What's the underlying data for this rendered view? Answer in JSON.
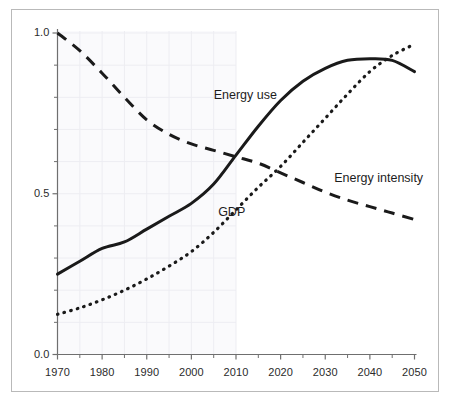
{
  "chart_data": {
    "type": "line",
    "title": "",
    "subtitle": "",
    "xlabel": "",
    "ylabel": "",
    "xlim": [
      1970,
      2050
    ],
    "ylim": [
      0.0,
      1.0
    ],
    "grid": "faint grid visible on left portion of plot only (1970-2010)",
    "legend_position": "inline annotations next to curves",
    "x_tick_labels": [
      "1970",
      "1980",
      "1990",
      "2000",
      "2010",
      "2020",
      "2030",
      "2040",
      "2050"
    ],
    "x_tick_values": [
      1970,
      1980,
      1990,
      2000,
      2010,
      2020,
      2030,
      2040,
      2050
    ],
    "x_minor_tick_values": [
      1975,
      1985,
      1995,
      2005,
      2015,
      2025,
      2035,
      2045
    ],
    "y_tick_labels": [
      "0.0",
      "0.5",
      "1.0"
    ],
    "y_tick_values": [
      0.0,
      0.5,
      1.0
    ],
    "y_minor_tick_values": [
      0.1,
      0.2,
      0.3,
      0.4,
      0.6,
      0.7,
      0.8,
      0.9
    ],
    "x": [
      1970,
      1975,
      1980,
      1985,
      1990,
      1995,
      2000,
      2005,
      2010,
      2015,
      2020,
      2025,
      2030,
      2035,
      2040,
      2045,
      2050
    ],
    "series": [
      {
        "name": "Energy use",
        "style": "solid",
        "color": "#1a1a1a",
        "label_text": "Energy use",
        "values": [
          0.25,
          0.29,
          0.33,
          0.35,
          0.39,
          0.43,
          0.47,
          0.53,
          0.62,
          0.71,
          0.79,
          0.85,
          0.89,
          0.915,
          0.92,
          0.915,
          0.88
        ]
      },
      {
        "name": "GDP",
        "style": "dotted",
        "color": "#1a1a1a",
        "label_text": "GDP",
        "values": [
          0.125,
          0.145,
          0.17,
          0.2,
          0.235,
          0.275,
          0.32,
          0.38,
          0.45,
          0.52,
          0.585,
          0.66,
          0.735,
          0.81,
          0.88,
          0.93,
          0.965
        ]
      },
      {
        "name": "Energy intensity",
        "style": "dashed",
        "color": "#1a1a1a",
        "label_text": "Energy intensity",
        "values": [
          1.0,
          0.945,
          0.875,
          0.8,
          0.73,
          0.685,
          0.655,
          0.635,
          0.615,
          0.595,
          0.565,
          0.535,
          0.505,
          0.48,
          0.46,
          0.44,
          0.42
        ]
      }
    ],
    "annotations": [
      {
        "text": "Energy use",
        "x": 2005,
        "y": 0.805
      },
      {
        "text": "Energy intensity",
        "x": 2032,
        "y": 0.545
      },
      {
        "text": "GDP",
        "x": 2006,
        "y": 0.44
      }
    ]
  },
  "axis": {
    "y_labels": [
      {
        "text": "1.0",
        "value": 1.0
      },
      {
        "text": "0.5",
        "value": 0.5
      },
      {
        "text": "0.0",
        "value": 0.0
      }
    ],
    "x_labels": [
      {
        "text": "1970",
        "value": 1970
      },
      {
        "text": "1980",
        "value": 1980
      },
      {
        "text": "1990",
        "value": 1990
      },
      {
        "text": "2000",
        "value": 2000
      },
      {
        "text": "2010",
        "value": 2010
      },
      {
        "text": "2020",
        "value": 2020
      },
      {
        "text": "2030",
        "value": 2030
      },
      {
        "text": "2040",
        "value": 2040
      },
      {
        "text": "2050",
        "value": 2050
      }
    ]
  },
  "colors": {
    "line": "#1a1a1a",
    "axis": "#6f6f6f",
    "grid": "#ededf2",
    "shade": "#fafafc",
    "frame": "#b9b9b9",
    "text": "#2b2b2b"
  }
}
